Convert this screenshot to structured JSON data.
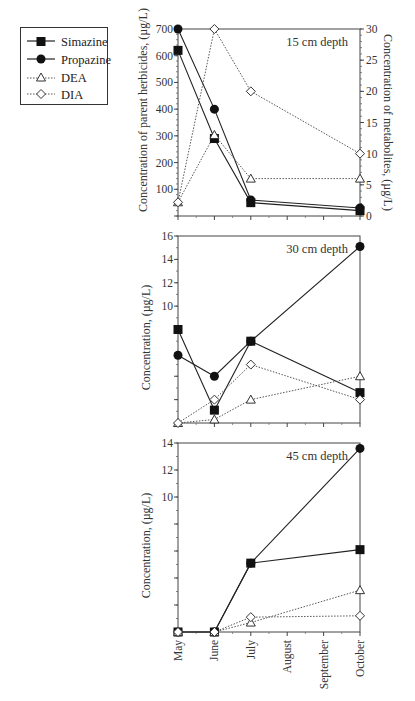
{
  "legend": {
    "items": [
      {
        "label": "Simazine",
        "marker": "filled-square",
        "line": "solid"
      },
      {
        "label": "Propazine",
        "marker": "filled-circle",
        "line": "solid"
      },
      {
        "label": "DEA",
        "marker": "open-triangle",
        "line": "dotted"
      },
      {
        "label": "DIA",
        "marker": "open-diamond",
        "line": "dotted"
      }
    ]
  },
  "chart_data": [
    {
      "type": "line",
      "title": "15 cm depth",
      "categories": [
        "May",
        "June",
        "July",
        "August",
        "September",
        "October"
      ],
      "x_positions": [
        0,
        1,
        2,
        3,
        4,
        5
      ],
      "ylabel": "Concentration of parent herbicides, (µg/L)",
      "ylabel_right": "Concentration of metabolites, (µg/L)",
      "ylim": [
        0,
        700
      ],
      "ylim_right": [
        0,
        30
      ],
      "yticks": [
        100,
        200,
        300,
        400,
        500,
        600,
        700
      ],
      "yticks_right": [
        0,
        5,
        10,
        15,
        20,
        25,
        30
      ],
      "series": [
        {
          "name": "Simazine",
          "axis": "left",
          "x": [
            0,
            1,
            2,
            5
          ],
          "values": [
            620,
            290,
            50,
            20
          ]
        },
        {
          "name": "Propazine",
          "axis": "left",
          "x": [
            0,
            1,
            2,
            5
          ],
          "values": [
            700,
            400,
            60,
            30
          ]
        },
        {
          "name": "DEA",
          "axis": "right",
          "x": [
            0,
            1,
            2,
            5
          ],
          "values": [
            2.2,
            13,
            6,
            6
          ]
        },
        {
          "name": "DIA",
          "axis": "right",
          "x": [
            0,
            1,
            2,
            5
          ],
          "values": [
            2.2,
            30,
            20,
            10
          ]
        }
      ]
    },
    {
      "type": "line",
      "title": "30 cm depth",
      "categories": [
        "May",
        "June",
        "July",
        "August",
        "September",
        "October"
      ],
      "ylabel": "Concentration, (µg/L)",
      "ylim": [
        0,
        16
      ],
      "yticks": [
        10,
        12,
        14,
        16
      ],
      "series": [
        {
          "name": "Simazine",
          "x": [
            0,
            1,
            2,
            5
          ],
          "values": [
            8.0,
            1.1,
            7.0,
            2.6
          ]
        },
        {
          "name": "Propazine",
          "x": [
            0,
            1,
            2,
            5
          ],
          "values": [
            5.8,
            4.0,
            7.0,
            15.1
          ]
        },
        {
          "name": "DEA",
          "x": [
            0,
            1,
            2,
            5
          ],
          "values": [
            0,
            0.3,
            2.0,
            4.0
          ]
        },
        {
          "name": "DIA",
          "x": [
            0,
            1,
            2,
            5
          ],
          "values": [
            0,
            2.0,
            5.0,
            2.0
          ]
        }
      ]
    },
    {
      "type": "line",
      "title": "45 cm depth",
      "categories": [
        "May",
        "June",
        "July",
        "August",
        "September",
        "October"
      ],
      "ylabel": "Concentration, (µg/L)",
      "xlabel": "",
      "ylim": [
        0,
        14
      ],
      "yticks": [
        10,
        12,
        14
      ],
      "series": [
        {
          "name": "Simazine",
          "x": [
            0,
            1,
            2,
            5
          ],
          "values": [
            0,
            0,
            5.1,
            6.1
          ]
        },
        {
          "name": "Propazine",
          "x": [
            0,
            1,
            2,
            5
          ],
          "values": [
            0,
            0,
            5.1,
            13.6
          ]
        },
        {
          "name": "DEA",
          "x": [
            0,
            1,
            2,
            5
          ],
          "values": [
            0,
            0,
            0.7,
            3.1
          ]
        },
        {
          "name": "DIA",
          "x": [
            0,
            1,
            2,
            5
          ],
          "values": [
            0,
            0,
            1.1,
            1.2
          ]
        }
      ]
    }
  ]
}
